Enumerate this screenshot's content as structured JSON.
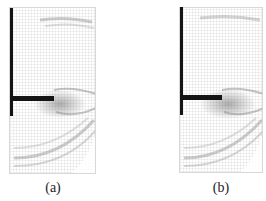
{
  "figure": {
    "panels": [
      {
        "id": "a",
        "label": "(a)",
        "description": "velocity vector field around L-shaped plate"
      },
      {
        "id": "b",
        "label": "(b)",
        "description": "velocity vector field around L-shaped plate"
      }
    ]
  },
  "colors": {
    "structure": "#141414",
    "vectors": "#8a8a8a",
    "background": "#ffffff",
    "frame": "#d8d8d8"
  }
}
